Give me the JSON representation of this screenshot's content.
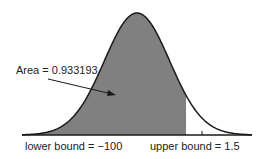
{
  "chart_data": {
    "type": "area",
    "title": "",
    "distribution": "standard normal",
    "annotation": "Area = 0.933193",
    "shaded_region": {
      "from": -100,
      "to": 1.5
    },
    "area_value": 0.933193,
    "lower_bound_label": "lower bound = −100",
    "upper_bound_label": "upper bound = 1.5",
    "x_tick_marks": [
      2
    ],
    "grid": false,
    "legend": null,
    "colors": {
      "shade": "#808080",
      "curve": "#1a1a1a",
      "axis": "#1a1a1a"
    }
  }
}
